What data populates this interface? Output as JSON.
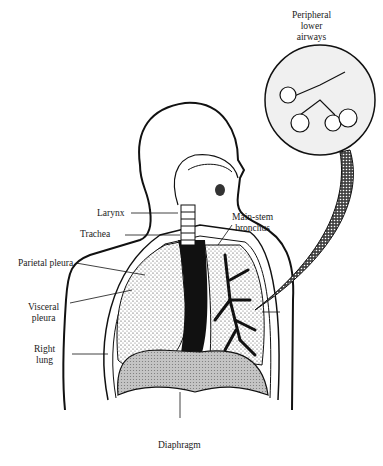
{
  "figure": {
    "labels": {
      "peripheral_airways_1": "Peripheral",
      "peripheral_airways_2": "lower",
      "peripheral_airways_3": "airways",
      "larynx": "Larynx",
      "trachea": "Trachea",
      "main_stem_1": "Main-stem",
      "main_stem_2": "bronchus",
      "parietal_pleura": "Parietal pleura",
      "visceral_pleura_1": "Visceral",
      "visceral_pleura_2": "pleura",
      "right_lung_1": "Right",
      "right_lung_2": "lung",
      "diaphragm": "Diaphragm"
    },
    "colors": {
      "ink": "#111111",
      "stipple": "#d9d9d9",
      "diaphragm_fill": "#bdbdbd",
      "inset_fill": "#efefef"
    }
  }
}
